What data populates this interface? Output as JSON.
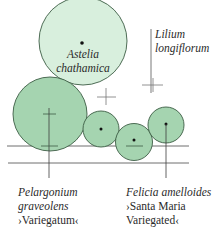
{
  "diagram": {
    "colors": {
      "light_fill": "#d8efdd",
      "dark_fill": "#a5d4b0",
      "stroke": "#3c5c44",
      "line": "#4a4a4a"
    },
    "plants": {
      "astelia": {
        "name_line1": "Astelia",
        "name_line2": "chathamica"
      },
      "lilium": {
        "name_line1": "Lilium",
        "name_line2": "longiflorum"
      },
      "pelargonium": {
        "name_line1": "Pelargonium",
        "name_line2": "graveolens",
        "cultivar": "›Variegatum‹"
      },
      "felicia": {
        "name_line1": "Felicia amelloides",
        "cultivar_line1": "›Santa Maria",
        "cultivar_line2": "Variegated‹"
      }
    }
  }
}
